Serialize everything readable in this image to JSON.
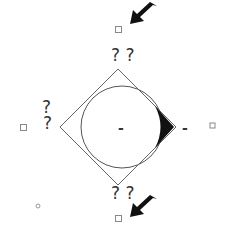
{
  "diagram": {
    "labels": {
      "top": "? ?",
      "bottom": "? ?",
      "left_upper": "?",
      "left": "?",
      "center": "-",
      "right": "-"
    },
    "colors": {
      "stroke": "#555555",
      "fill_dark": "#111111",
      "handle": "#888888"
    },
    "icons": [
      "arrow-top-icon",
      "arrow-bottom-icon",
      "rotate-handle-icon",
      "checkbox-icon"
    ]
  }
}
